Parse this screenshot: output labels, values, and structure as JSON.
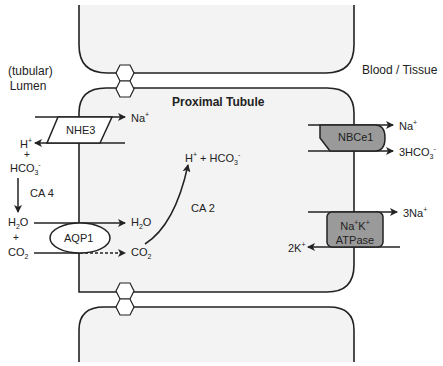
{
  "diagram": {
    "title": "Proximal Tubule",
    "compartments": {
      "lumen": [
        "(tubular)",
        "Lumen"
      ],
      "blood": "Blood / Tissue"
    },
    "colors": {
      "cell_fill": "#f3f3f3",
      "outline": "#222222",
      "transporter_fill": "#9a9a9a",
      "background": "#ffffff"
    },
    "transporters": {
      "nhe3": {
        "label": "NHE3",
        "in": "Na",
        "in_sup": "+",
        "out": "H",
        "out_sup": "+"
      },
      "aqp1": {
        "label": "AQP1"
      },
      "nbce1": {
        "label": "NBCe1",
        "out1": "Na",
        "out1_sup": "+",
        "out2_pre": "3HCO",
        "out2_sub": "3",
        "out2_sup": "-"
      },
      "nak_atpase": {
        "label_line1_a": "Na",
        "label_line1_b": "K",
        "label_sup": "+",
        "label_line2": "ATPase",
        "out": "3Na",
        "out_sup": "+",
        "in": "2K",
        "in_sup": "+"
      }
    },
    "lumen_species": {
      "hco3_plus": "+",
      "hco3": "HCO",
      "hco3_sub": "3",
      "hco3_sup": "-",
      "enzyme_ca4": "CA 4",
      "h2o_left": "H",
      "h2o_sub": "2",
      "h2o_o": "O",
      "plus2": "+",
      "co2_left": "CO",
      "co2_sub": "2"
    },
    "cell_species": {
      "h2o": "H",
      "h2o_sub": "2",
      "h2o_o": "O",
      "co2": "CO",
      "co2_sub": "2",
      "products_h": "H",
      "products_h_sup": "+",
      "products_plus": "+",
      "products_hco3": "HCO",
      "products_hco3_sub": "3",
      "products_hco3_sup": "-",
      "enzyme_ca2": "CA 2"
    }
  }
}
